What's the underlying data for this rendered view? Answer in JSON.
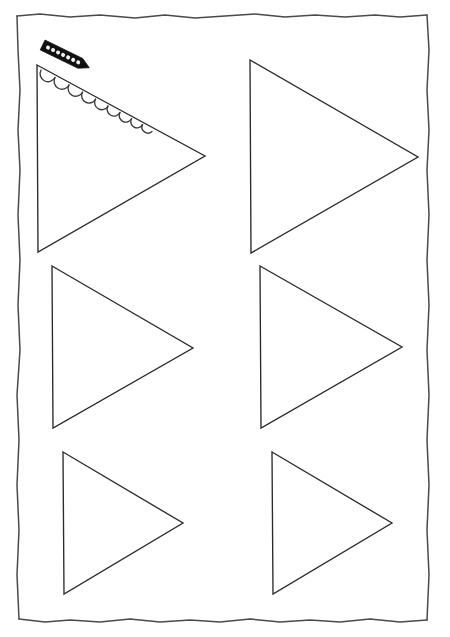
{
  "page": {
    "title": "Pennant Flag Template Sheet",
    "background_color": "#ffffff",
    "ink_color": "#2b2b2b",
    "border_color": "#4a4a4a",
    "width": 450,
    "height": 637
  },
  "border": {
    "name": "hand-drawn-page-border",
    "style": "wobbly hand drawn rectangle",
    "top_left": [
      17,
      15
    ],
    "bottom_right": [
      427,
      620
    ]
  },
  "tool": {
    "name": "scallop-edge-ruler",
    "label": "Scallop edge ruler",
    "fill_color": "#111111",
    "hole_color": "#f2f2f2",
    "hole_count": 7,
    "angle_degrees": 26,
    "start": [
      45,
      40
    ],
    "end": [
      90,
      62
    ]
  },
  "scallops": {
    "name": "scalloped-edge-decoration",
    "label": "Scalloped trim on first pennant",
    "arc_count": 9,
    "stroke_color": "#3a3a3a",
    "applied_to": "triangle-1"
  },
  "triangles": [
    {
      "id": "triangle-1",
      "name": "pennant-template-1",
      "row": 1,
      "column": 1,
      "decorated": true,
      "top_left": [
        37,
        65
      ],
      "bottom_left": [
        38,
        252
      ],
      "tip": [
        205,
        156
      ]
    },
    {
      "id": "triangle-2",
      "name": "pennant-template-2",
      "row": 1,
      "column": 2,
      "decorated": false,
      "top_left": [
        250,
        60
      ],
      "bottom_left": [
        251,
        253
      ],
      "tip": [
        418,
        157
      ]
    },
    {
      "id": "triangle-3",
      "name": "pennant-template-3",
      "row": 2,
      "column": 1,
      "decorated": false,
      "top_left": [
        52,
        266
      ],
      "bottom_left": [
        53,
        428
      ],
      "tip": [
        193,
        348
      ]
    },
    {
      "id": "triangle-4",
      "name": "pennant-template-4",
      "row": 2,
      "column": 2,
      "decorated": false,
      "top_left": [
        260,
        266
      ],
      "bottom_left": [
        261,
        428
      ],
      "tip": [
        402,
        347
      ]
    },
    {
      "id": "triangle-5",
      "name": "pennant-template-5",
      "row": 3,
      "column": 1,
      "decorated": false,
      "top_left": [
        63,
        452
      ],
      "bottom_left": [
        64,
        594
      ],
      "tip": [
        183,
        523
      ]
    },
    {
      "id": "triangle-6",
      "name": "pennant-template-6",
      "row": 3,
      "column": 2,
      "decorated": false,
      "top_left": [
        272,
        452
      ],
      "bottom_left": [
        273,
        594
      ],
      "tip": [
        392,
        523
      ]
    }
  ]
}
